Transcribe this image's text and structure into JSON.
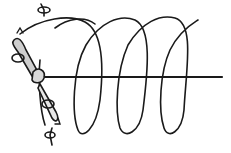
{
  "diagram": {
    "type": "line-art illustration",
    "colors": {
      "ink": "#1a1a1a",
      "background": "#ffffff"
    },
    "elements": {
      "axis": "horizontal-axis-line",
      "helix_turns": 4,
      "body": "elongated spinning body tilted diagonally",
      "rotation_arrows": 4
    }
  }
}
